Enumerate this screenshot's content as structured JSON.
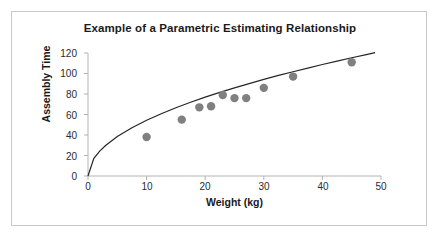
{
  "chart_data": {
    "type": "scatter",
    "title": "Example of a Parametric Estimating Relationship",
    "xlabel": "Weight (kg)",
    "ylabel": "Assembly Time",
    "xlim": [
      0,
      50
    ],
    "ylim": [
      0,
      120
    ],
    "xticks": [
      "0",
      "10",
      "20",
      "30",
      "40",
      "50"
    ],
    "yticks": [
      "0",
      "20",
      "40",
      "60",
      "80",
      "100",
      "120"
    ],
    "grid": false,
    "legend": null,
    "marker_color": "#808080",
    "line_color": "#262626",
    "axis_color": "#b3b3b3",
    "series": [
      {
        "name": "Observed assemblies",
        "type": "scatter",
        "x": [
          10,
          16,
          19,
          21,
          23,
          25,
          27,
          30,
          35,
          45
        ],
        "y": [
          38,
          55,
          67,
          68,
          79,
          76,
          76,
          86,
          97,
          111
        ]
      },
      {
        "name": "Fitted power curve",
        "type": "line",
        "equation": "y = 17.2 * x^0.5",
        "x": [
          0,
          1,
          2,
          3,
          5,
          7.5,
          10,
          12.5,
          15,
          17.5,
          20,
          22.5,
          25,
          27.5,
          30,
          32.5,
          35,
          37.5,
          40,
          42.5,
          45,
          47.5,
          49
        ],
        "y": [
          0,
          17.2,
          24.3,
          29.8,
          38.5,
          47.1,
          54.4,
          60.8,
          66.6,
          71.9,
          76.9,
          81.6,
          86.0,
          90.2,
          94.2,
          98.1,
          101.7,
          105.3,
          108.8,
          112.1,
          115.4,
          118.5,
          120.4
        ]
      }
    ]
  }
}
